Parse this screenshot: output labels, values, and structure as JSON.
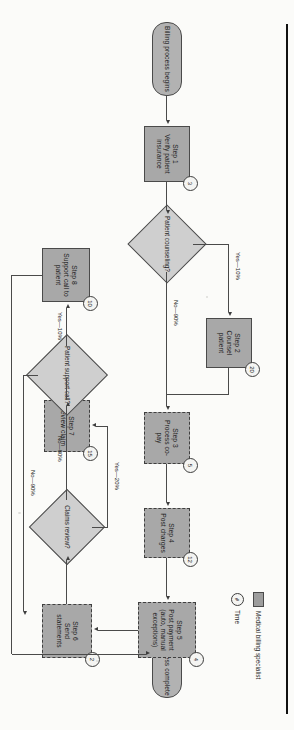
{
  "diagram": {
    "orientation": "rotated-90",
    "colors": {
      "process_fill": "#a8a8a8",
      "decision_fill": "#cfcfcf",
      "terminator_fill": "#b2b2b2",
      "line": "#4a4a4a",
      "text": "#1c1c1c"
    }
  },
  "nodes": {
    "start": {
      "label": "Billing process begins"
    },
    "end": {
      "label": "Billing process complete"
    },
    "step1": {
      "step": "Step 1",
      "label": "Verify patient insurance",
      "badge": "3"
    },
    "step2": {
      "step": "Step 2",
      "label": "Counsel patient",
      "badge": "20"
    },
    "step3": {
      "step": "Step 3",
      "label": "Process co-pay",
      "badge": "5"
    },
    "step4": {
      "step": "Step 4",
      "label": "Post charges",
      "badge": "12"
    },
    "step5": {
      "step": "Step 5",
      "label": "Post payment (auto, manual exceptions)",
      "badge": "4"
    },
    "step6": {
      "step": "Step 6",
      "label": "Send statements",
      "badge": "2"
    },
    "step7": {
      "step": "Step 7",
      "label": "Review claim",
      "badge": "15"
    },
    "step8": {
      "step": "Step 8",
      "label": "Support call to patient",
      "badge": "10"
    },
    "decision1": {
      "label": "Patient counseling?"
    },
    "decision2": {
      "label": "Claims review?"
    },
    "decision3": {
      "label": "Patient support call?"
    }
  },
  "edge_labels": {
    "counseling_yes": "Yes—10%",
    "counseling_no": "No—90%",
    "claims_yes": "Yes—20%",
    "claims_no": "No—80%",
    "support_yes": "Yes—10%",
    "support_no": "No—90%"
  },
  "legend": {
    "role_label": "Medical billing specialist",
    "time_label": "Time",
    "time_symbol": "#"
  }
}
